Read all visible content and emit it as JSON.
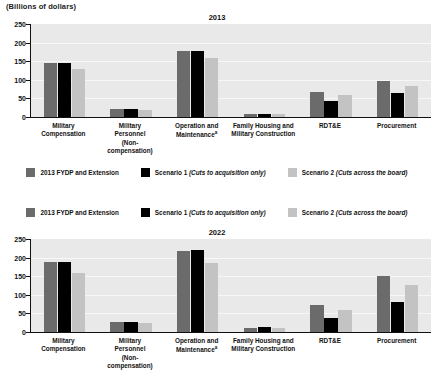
{
  "units_label": "(Billions of dollars)",
  "legend": {
    "items": [
      {
        "label": "2013 FYDP and Extension",
        "color": "#6b6b6b",
        "key": "fydp"
      },
      {
        "label": "Scenario 1 (Cuts to acquisition only)",
        "color": "#000000",
        "key": "scenario1"
      },
      {
        "label": "Scenario 2 (Cuts across the board)",
        "color": "#c3c3c3",
        "key": "scenario2"
      }
    ]
  },
  "categories": [
    "Military Compensation",
    "Military Personnel (Non-compensation)",
    "Operation and Maintenance*",
    "Family Housing and Military Construction",
    "RDT&E",
    "Procurement"
  ],
  "chart_data": [
    {
      "type": "bar",
      "title": "2013",
      "xlabel": "",
      "ylabel": "(Billions of dollars)",
      "ylim": [
        0,
        250
      ],
      "yticks": [
        0,
        50,
        100,
        150,
        200,
        250
      ],
      "grid": true,
      "legend_position": "bottom",
      "categories": [
        "Military Compensation",
        "Military Personnel (Non-compensation)",
        "Operation and Maintenance",
        "Family Housing and Military Construction",
        "RDT&E",
        "Procurement"
      ],
      "series": [
        {
          "name": "2013 FYDP and Extension",
          "color": "#6b6b6b",
          "values": [
            144,
            21,
            177,
            8,
            67,
            96
          ]
        },
        {
          "name": "Scenario 1 (Cuts to acquisition only)",
          "color": "#000000",
          "values": [
            145,
            22,
            178,
            8,
            44,
            64
          ]
        },
        {
          "name": "Scenario 2 (Cuts across the board)",
          "color": "#c3c3c3",
          "values": [
            129,
            20,
            158,
            7,
            60,
            84
          ]
        }
      ]
    },
    {
      "type": "bar",
      "title": "2022",
      "xlabel": "",
      "ylabel": "(Billions of dollars)",
      "ylim": [
        0,
        250
      ],
      "yticks": [
        0,
        50,
        100,
        150,
        200,
        250
      ],
      "grid": true,
      "legend_position": "top",
      "categories": [
        "Military Compensation",
        "Military Personnel (Non-compensation)",
        "Operation and Maintenance",
        "Family Housing and Military Construction",
        "RDT&E",
        "Procurement"
      ],
      "series": [
        {
          "name": "2013 FYDP and Extension",
          "color": "#6b6b6b",
          "values": [
            188,
            27,
            219,
            12,
            72,
            151
          ]
        },
        {
          "name": "Scenario 1 (Cuts to acquisition only)",
          "color": "#000000",
          "values": [
            189,
            28,
            220,
            13,
            38,
            80
          ]
        },
        {
          "name": "Scenario 2 (Cuts across the board)",
          "color": "#c3c3c3",
          "values": [
            159,
            23,
            185,
            11,
            60,
            127
          ]
        }
      ]
    }
  ],
  "category_label_lines": [
    [
      "Military",
      "Compensation"
    ],
    [
      "Military",
      "Personnel",
      "(Non-",
      "compensation)"
    ],
    [
      "Operation and",
      "Maintenance"
    ],
    [
      "Family Housing and",
      "Military Construction"
    ],
    [
      "RDT&E"
    ],
    [
      "Procurement"
    ]
  ],
  "footnote_marker": "a"
}
